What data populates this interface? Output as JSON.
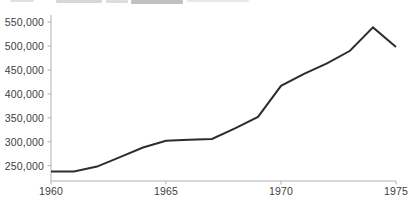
{
  "chart_data": {
    "type": "line",
    "title": "",
    "xlabel": "",
    "ylabel": "",
    "grid": false,
    "legend": "none",
    "x": [
      1960,
      1961,
      1962,
      1963,
      1964,
      1965,
      1966,
      1967,
      1968,
      1969,
      1970,
      1971,
      1972,
      1973,
      1974,
      1975
    ],
    "values": [
      238000,
      238000,
      248000,
      268000,
      288000,
      302000,
      304000,
      306000,
      328000,
      352000,
      417000,
      442000,
      464000,
      490000,
      539000,
      498000
    ],
    "x_tick_years": [
      1960,
      1965,
      1970,
      1975
    ],
    "x_tick_labels": [
      "1960",
      "1965",
      "1970",
      "1975"
    ],
    "y_tick_values": [
      550000,
      500000,
      450000,
      400000,
      350000,
      300000,
      250000
    ],
    "y_tick_labels": [
      "550,000",
      "500,000",
      "450,000",
      "400,000",
      "350,000",
      "300,000",
      "250,000"
    ],
    "xlim": [
      1960,
      1975.6
    ],
    "ylim": [
      218000,
      567000
    ],
    "line_color": "#2d2d2d",
    "axis_color": "#b0b0b0",
    "tick_label_color": "#3e3e3e",
    "background_color": "#ffffff"
  }
}
